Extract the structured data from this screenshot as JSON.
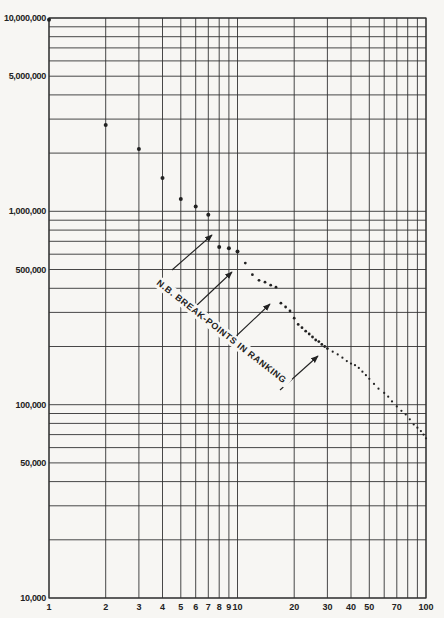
{
  "chart_data": {
    "type": "scatter",
    "title": "",
    "xlabel": "",
    "ylabel": "",
    "xscale": "log",
    "yscale": "log",
    "xlim": [
      1,
      100
    ],
    "ylim": [
      10000,
      10000000
    ],
    "grid": true,
    "legend": null,
    "x_tick_labels": [
      "1",
      "2",
      "3",
      "4",
      "5",
      "6",
      "7",
      "8",
      "9",
      "10",
      "20",
      "30",
      "40",
      "50",
      "70",
      "100"
    ],
    "x_gridlines": [
      1,
      2,
      3,
      4,
      5,
      6,
      7,
      8,
      9,
      10,
      20,
      30,
      40,
      50,
      60,
      70,
      80,
      90,
      100
    ],
    "y_tick_labels": [
      {
        "value": 10000000,
        "label": "10,000,000"
      },
      {
        "value": 5000000,
        "label": "5,000,000"
      },
      {
        "value": 1000000,
        "label": "1,000,000"
      },
      {
        "value": 500000,
        "label": "500,000"
      },
      {
        "value": 100000,
        "label": "100,000"
      },
      {
        "value": 50000,
        "label": "50,000"
      },
      {
        "value": 10000,
        "label": "10,000"
      }
    ],
    "y_gridlines": [
      10000,
      20000,
      30000,
      40000,
      50000,
      60000,
      70000,
      80000,
      90000,
      100000,
      200000,
      300000,
      400000,
      500000,
      600000,
      700000,
      800000,
      900000,
      1000000,
      2000000,
      3000000,
      4000000,
      5000000,
      6000000,
      7000000,
      8000000,
      9000000,
      10000000
    ],
    "series": [
      {
        "name": "rank-size",
        "x": [
          1,
          2,
          3,
          4,
          5,
          6,
          7,
          8,
          9,
          10,
          11,
          12,
          13,
          14,
          15,
          16,
          17,
          18,
          19,
          20,
          21,
          22,
          23,
          24,
          25,
          26,
          27,
          28,
          29,
          30,
          32,
          34,
          36,
          38,
          40,
          42,
          44,
          46,
          48,
          50,
          53,
          56,
          60,
          63,
          66,
          70,
          74,
          78,
          82,
          86,
          90,
          94,
          97,
          100
        ],
        "values": [
          9800000,
          2800000,
          2100000,
          1490000,
          1160000,
          1060000,
          960000,
          655000,
          645000,
          620000,
          540000,
          470000,
          440000,
          430000,
          415000,
          405000,
          335000,
          320000,
          305000,
          280000,
          260000,
          250000,
          240000,
          232000,
          224000,
          216000,
          212000,
          205000,
          200000,
          195000,
          188000,
          182000,
          175000,
          168000,
          163000,
          160000,
          155000,
          148000,
          142000,
          136000,
          128000,
          121000,
          115000,
          110000,
          104000,
          98000,
          93000,
          89000,
          84000,
          79000,
          76000,
          73000,
          70000,
          67000
        ]
      }
    ],
    "annotations": [
      {
        "text": "N.B.  BREAK-POINTS  IN  RANKING",
        "rotation_deg": 38
      },
      {
        "type": "arrow",
        "from": [
          172,
          270
        ],
        "to": [
          212,
          235
        ]
      },
      {
        "type": "arrow",
        "from": [
          196,
          306
        ],
        "to": [
          232,
          272
        ]
      },
      {
        "type": "arrow",
        "from": [
          232,
          340
        ],
        "to": [
          270,
          304
        ]
      },
      {
        "type": "arrow",
        "from": [
          280,
          390
        ],
        "to": [
          318,
          356
        ]
      }
    ]
  }
}
